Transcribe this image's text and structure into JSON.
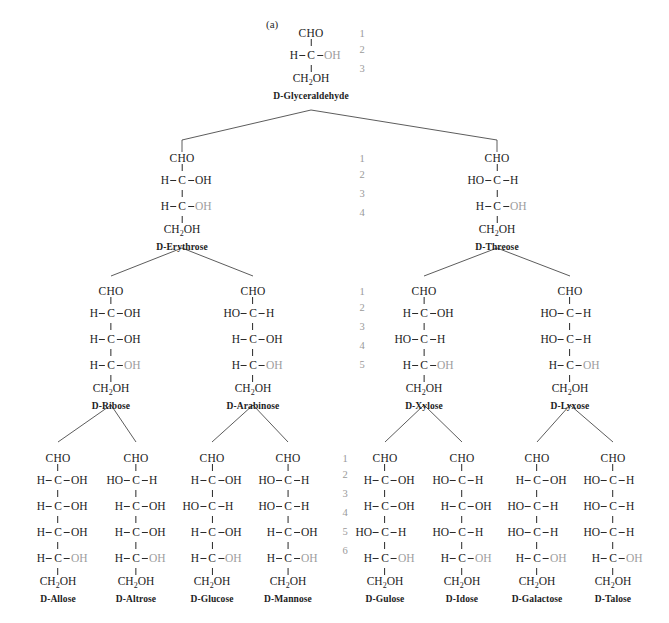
{
  "figure": {
    "panel_label": "(a)",
    "colors": {
      "text": "#1c1c1c",
      "dim_text": "#9d9d9d",
      "bond": "#2a2a2a",
      "number": "#9a9a9a",
      "background": "#ffffff"
    }
  },
  "glyphs": {
    "cho": "CHO",
    "ch2oh_a": "CH",
    "ch2oh_sub": "2",
    "ch2oh_b": "OH",
    "carbon": "C",
    "h": "H",
    "oh": "OH",
    "ho": "HO"
  },
  "levels": [
    {
      "name": "triose",
      "carbon_numbers": [
        "1",
        "2",
        "3"
      ],
      "number_column_x": 355,
      "molecules": [
        {
          "name": "D-Glyceraldehyde",
          "x": 311,
          "y": 27,
          "stereocenters": [
            {
              "left": "H",
              "right": "OH",
              "dim": true
            }
          ]
        }
      ]
    },
    {
      "name": "tetrose",
      "carbon_numbers": [
        "1",
        "2",
        "3",
        "4"
      ],
      "number_column_x": 355,
      "molecules": [
        {
          "name": "D-Erythrose",
          "x": 182,
          "y": 152,
          "stereocenters": [
            {
              "left": "H",
              "right": "OH",
              "dim": false
            },
            {
              "left": "H",
              "right": "OH",
              "dim": true
            }
          ]
        },
        {
          "name": "D-Threose",
          "x": 497,
          "y": 152,
          "stereocenters": [
            {
              "left": "HO",
              "right": "H",
              "dim": false
            },
            {
              "left": "H",
              "right": "OH",
              "dim": true
            }
          ]
        }
      ]
    },
    {
      "name": "pentose",
      "carbon_numbers": [
        "1",
        "2",
        "3",
        "4",
        "5"
      ],
      "number_column_x": 355,
      "molecules": [
        {
          "name": "D-Ribose",
          "x": 111,
          "y": 285,
          "stereocenters": [
            {
              "left": "H",
              "right": "OH",
              "dim": false
            },
            {
              "left": "H",
              "right": "OH",
              "dim": false
            },
            {
              "left": "H",
              "right": "OH",
              "dim": true
            }
          ]
        },
        {
          "name": "D-Arabinose",
          "x": 253,
          "y": 285,
          "stereocenters": [
            {
              "left": "HO",
              "right": "H",
              "dim": false
            },
            {
              "left": "H",
              "right": "OH",
              "dim": false
            },
            {
              "left": "H",
              "right": "OH",
              "dim": true
            }
          ]
        },
        {
          "name": "D-Xylose",
          "x": 424,
          "y": 285,
          "stereocenters": [
            {
              "left": "H",
              "right": "OH",
              "dim": false
            },
            {
              "left": "HO",
              "right": "H",
              "dim": false
            },
            {
              "left": "H",
              "right": "OH",
              "dim": true
            }
          ]
        },
        {
          "name": "D-Lyxose",
          "x": 570,
          "y": 285,
          "stereocenters": [
            {
              "left": "HO",
              "right": "H",
              "dim": false
            },
            {
              "left": "HO",
              "right": "H",
              "dim": false
            },
            {
              "left": "H",
              "right": "OH",
              "dim": true
            }
          ]
        }
      ]
    },
    {
      "name": "hexose",
      "carbon_numbers": [
        "1",
        "2",
        "3",
        "4",
        "5",
        "6"
      ],
      "number_column_x": 338,
      "molecules": [
        {
          "name": "D-Allose",
          "x": 58,
          "y": 452,
          "stereocenters": [
            {
              "left": "H",
              "right": "OH",
              "dim": false
            },
            {
              "left": "H",
              "right": "OH",
              "dim": false
            },
            {
              "left": "H",
              "right": "OH",
              "dim": false
            },
            {
              "left": "H",
              "right": "OH",
              "dim": true
            }
          ]
        },
        {
          "name": "D-Altrose",
          "x": 136,
          "y": 452,
          "stereocenters": [
            {
              "left": "HO",
              "right": "H",
              "dim": false
            },
            {
              "left": "H",
              "right": "OH",
              "dim": false
            },
            {
              "left": "H",
              "right": "OH",
              "dim": false
            },
            {
              "left": "H",
              "right": "OH",
              "dim": true
            }
          ]
        },
        {
          "name": "D-Glucose",
          "x": 212,
          "y": 452,
          "stereocenters": [
            {
              "left": "H",
              "right": "OH",
              "dim": false
            },
            {
              "left": "HO",
              "right": "H",
              "dim": false
            },
            {
              "left": "H",
              "right": "OH",
              "dim": false
            },
            {
              "left": "H",
              "right": "OH",
              "dim": true
            }
          ]
        },
        {
          "name": "D-Mannose",
          "x": 288,
          "y": 452,
          "stereocenters": [
            {
              "left": "HO",
              "right": "H",
              "dim": false
            },
            {
              "left": "HO",
              "right": "H",
              "dim": false
            },
            {
              "left": "H",
              "right": "OH",
              "dim": false
            },
            {
              "left": "H",
              "right": "OH",
              "dim": true
            }
          ]
        },
        {
          "name": "D-Gulose",
          "x": 385,
          "y": 452,
          "stereocenters": [
            {
              "left": "H",
              "right": "OH",
              "dim": false
            },
            {
              "left": "H",
              "right": "OH",
              "dim": false
            },
            {
              "left": "HO",
              "right": "H",
              "dim": false
            },
            {
              "left": "H",
              "right": "OH",
              "dim": true
            }
          ]
        },
        {
          "name": "D-Idose",
          "x": 462,
          "y": 452,
          "stereocenters": [
            {
              "left": "HO",
              "right": "H",
              "dim": false
            },
            {
              "left": "H",
              "right": "OH",
              "dim": false
            },
            {
              "left": "HO",
              "right": "H",
              "dim": false
            },
            {
              "left": "H",
              "right": "OH",
              "dim": true
            }
          ]
        },
        {
          "name": "D-Galactose",
          "x": 537,
          "y": 452,
          "stereocenters": [
            {
              "left": "H",
              "right": "OH",
              "dim": false
            },
            {
              "left": "HO",
              "right": "H",
              "dim": false
            },
            {
              "left": "HO",
              "right": "H",
              "dim": false
            },
            {
              "left": "H",
              "right": "OH",
              "dim": true
            }
          ]
        },
        {
          "name": "D-Talose",
          "x": 613,
          "y": 452,
          "stereocenters": [
            {
              "left": "HO",
              "right": "H",
              "dim": false
            },
            {
              "left": "HO",
              "right": "H",
              "dim": false
            },
            {
              "left": "HO",
              "right": "H",
              "dim": false
            },
            {
              "left": "H",
              "right": "OH",
              "dim": true
            }
          ]
        }
      ]
    }
  ],
  "connectors": [
    {
      "parent": "D-Glyceraldehyde",
      "px": 311,
      "py": 110,
      "children": [
        182,
        497
      ],
      "drop_y": 140
    },
    {
      "parent": "D-Erythrose",
      "px": 182,
      "py": 248,
      "children": [
        111,
        253
      ],
      "drop_y": 276
    },
    {
      "parent": "D-Threose",
      "px": 497,
      "py": 248,
      "children": [
        424,
        570
      ],
      "drop_y": 276
    },
    {
      "parent": "D-Ribose",
      "px": 111,
      "py": 405,
      "children": [
        58,
        136
      ],
      "drop_y": 442
    },
    {
      "parent": "D-Arabinose",
      "px": 253,
      "py": 405,
      "children": [
        212,
        288
      ],
      "drop_y": 442
    },
    {
      "parent": "D-Xylose",
      "px": 424,
      "py": 405,
      "children": [
        385,
        462
      ],
      "drop_y": 442
    },
    {
      "parent": "D-Lyxose",
      "px": 570,
      "py": 405,
      "children": [
        537,
        613
      ],
      "drop_y": 442
    }
  ]
}
